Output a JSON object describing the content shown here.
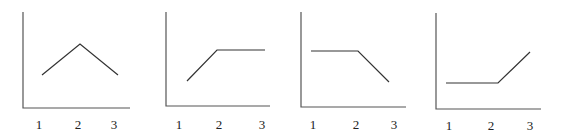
{
  "chart_data": [
    {
      "type": "line",
      "title": "",
      "xlabel": "",
      "ylabel": "",
      "categories": [
        "1",
        "2",
        "3"
      ],
      "values": [
        1,
        2,
        1
      ],
      "shape": "rise-then-fall",
      "grid": false,
      "legend": null
    },
    {
      "type": "line",
      "title": "",
      "xlabel": "",
      "ylabel": "",
      "categories": [
        "1",
        "2",
        "3"
      ],
      "values": [
        1,
        2,
        2
      ],
      "shape": "rise-then-flat",
      "grid": false,
      "legend": null
    },
    {
      "type": "line",
      "title": "",
      "xlabel": "",
      "ylabel": "",
      "categories": [
        "1",
        "2",
        "3"
      ],
      "values": [
        2,
        2,
        1
      ],
      "shape": "flat-then-fall",
      "grid": false,
      "legend": null
    },
    {
      "type": "line",
      "title": "",
      "xlabel": "",
      "ylabel": "",
      "categories": [
        "1",
        "2",
        "3"
      ],
      "values": [
        1,
        1,
        2
      ],
      "shape": "flat-then-rise",
      "grid": false,
      "legend": null
    }
  ],
  "panels": [
    {
      "ticks": [
        "1",
        "2",
        "3"
      ]
    },
    {
      "ticks": [
        "1",
        "2",
        "3"
      ]
    },
    {
      "ticks": [
        "1",
        "2",
        "3"
      ]
    },
    {
      "ticks": [
        "1",
        "2",
        "3"
      ]
    }
  ]
}
